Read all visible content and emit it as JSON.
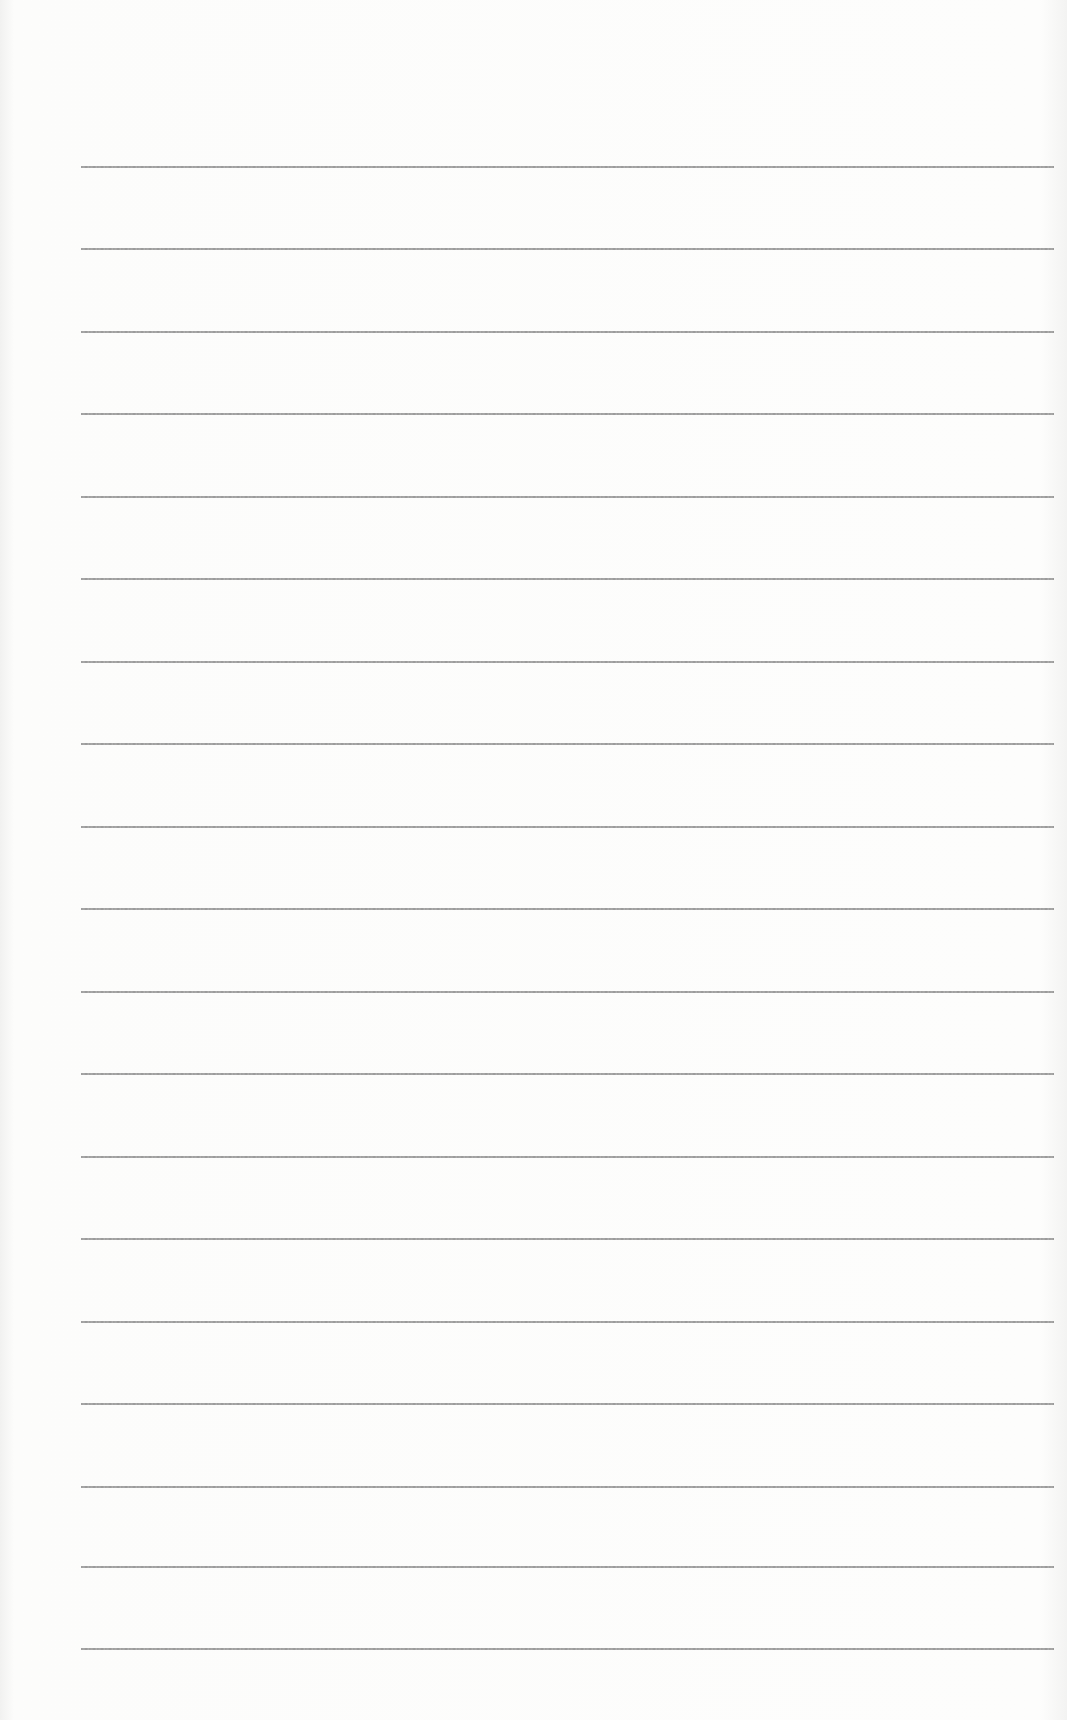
{
  "document": {
    "type": "lined-paper",
    "line_count": 19,
    "line_color": "#8c8c8c",
    "background_color": "#fdfdfc",
    "lines": [
      {
        "y": 166
      },
      {
        "y": 248
      },
      {
        "y": 331
      },
      {
        "y": 413
      },
      {
        "y": 496
      },
      {
        "y": 578
      },
      {
        "y": 661
      },
      {
        "y": 743
      },
      {
        "y": 826
      },
      {
        "y": 908
      },
      {
        "y": 991
      },
      {
        "y": 1073
      },
      {
        "y": 1156
      },
      {
        "y": 1238
      },
      {
        "y": 1321
      },
      {
        "y": 1403
      },
      {
        "y": 1486
      },
      {
        "y": 1566
      },
      {
        "y": 1648
      }
    ]
  }
}
